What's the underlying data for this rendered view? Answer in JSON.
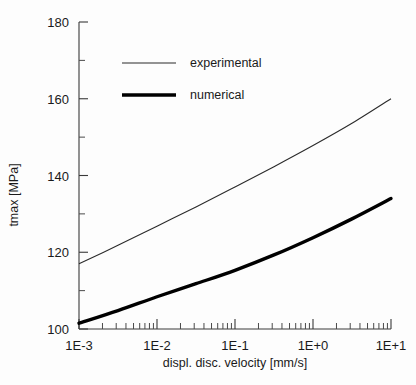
{
  "chart_data": {
    "type": "line",
    "title": "",
    "xlabel": "displ. disc. velocity   [mm/s]",
    "ylabel": "tmax  [MPa]",
    "xscale": "log",
    "yscale": "linear",
    "xlim": [
      0.001,
      10
    ],
    "ylim": [
      100,
      180
    ],
    "grid": false,
    "legend_position": "upper-center",
    "x_tick_labels": [
      "1E-3",
      "1E-2",
      "1E-1",
      "1E+0",
      "1E+1"
    ],
    "x_tick_values": [
      0.001,
      0.01,
      0.1,
      1,
      10
    ],
    "y_tick_labels": [
      "100",
      "120",
      "140",
      "160",
      "180"
    ],
    "y_tick_values": [
      100,
      120,
      140,
      160,
      180
    ],
    "y_minor_ticks": [
      110,
      130,
      150,
      170
    ],
    "x": [
      0.001,
      0.00316,
      0.01,
      0.0316,
      0.1,
      0.316,
      1,
      3.16,
      10
    ],
    "series": [
      {
        "name": "experimental",
        "style": "thin",
        "values": [
          117.0,
          121.8,
          126.8,
          131.8,
          137.0,
          142.3,
          147.8,
          153.6,
          160.0
        ]
      },
      {
        "name": "numerical",
        "style": "thick",
        "values": [
          101.5,
          104.8,
          108.4,
          111.8,
          115.3,
          119.3,
          123.8,
          128.7,
          134.0
        ]
      }
    ]
  },
  "legend": {
    "items": [
      {
        "label": "experimental"
      },
      {
        "label": "numerical"
      }
    ]
  }
}
